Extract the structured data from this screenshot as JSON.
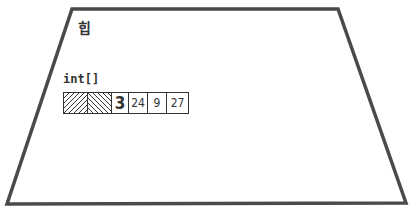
{
  "diagram": {
    "region_label": "힙",
    "array": {
      "type_label": "int[]",
      "header_cells": [
        {
          "kind": "hatch-forward",
          "width": 23
        },
        {
          "kind": "hatch-backward",
          "width": 24
        }
      ],
      "length": "3",
      "values": [
        "24",
        "9",
        "27"
      ]
    },
    "colors": {
      "stroke": "#4a4a4a",
      "text": "#333333",
      "background": "#ffffff"
    },
    "shape": {
      "type": "trapezoid",
      "points": [
        [
          72,
          9
        ],
        [
          338,
          9
        ],
        [
          406,
          203
        ],
        [
          7,
          204
        ]
      ]
    }
  }
}
